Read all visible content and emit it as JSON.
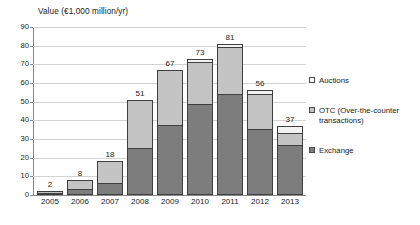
{
  "chart_data": {
    "type": "bar",
    "subtype": "stacked-bar",
    "title": "",
    "xlabel": "",
    "ylabel": "Value (€1,000 million/yr)",
    "ylim": [
      0,
      90
    ],
    "yticks": [
      0,
      10,
      20,
      30,
      40,
      50,
      60,
      70,
      80,
      90
    ],
    "ytick_labels": [
      "0",
      "10",
      "20",
      "30",
      "40",
      "50",
      "60",
      "70",
      "80",
      "90"
    ],
    "grid": true,
    "legend_position": "right",
    "categories": [
      "2005",
      "2006",
      "2007",
      "2008",
      "2009",
      "2010",
      "2011",
      "2012",
      "2013"
    ],
    "series": [
      {
        "name": "Exchange",
        "color": "#7d7d7d",
        "values": [
          1,
          3,
          6.5,
          25,
          37.5,
          49,
          54,
          35.5,
          27
        ]
      },
      {
        "name": "OTC (Over-the-counter transactions)",
        "color": "#c4c4c4",
        "values": [
          1,
          5,
          11.5,
          26,
          29.5,
          22,
          25.5,
          18.5,
          6
        ]
      },
      {
        "name": "Auctions",
        "color": "#f2f2f2",
        "values": [
          0,
          0,
          0,
          0,
          0,
          2,
          1.5,
          2,
          4
        ]
      }
    ],
    "totals": [
      2,
      8,
      18,
      51,
      67,
      73,
      81,
      56,
      37
    ],
    "data_labels": [
      "2",
      "8",
      "18",
      "51",
      "67",
      "73",
      "81",
      "56",
      "37"
    ]
  },
  "legend": {
    "items": [
      {
        "label": "Auctions",
        "key": "auctions"
      },
      {
        "label": "OTC (Over-the-counter transactions)",
        "key": "otc"
      },
      {
        "label": "Exchange",
        "key": "exchange"
      }
    ]
  },
  "colors": {
    "exchange": "#7d7d7d",
    "otc": "#c4c4c4",
    "auctions": "#f2f2f2",
    "gridline": "#d2d2d2",
    "axis": "#8a8a8a",
    "text": "#1a1a1a"
  }
}
